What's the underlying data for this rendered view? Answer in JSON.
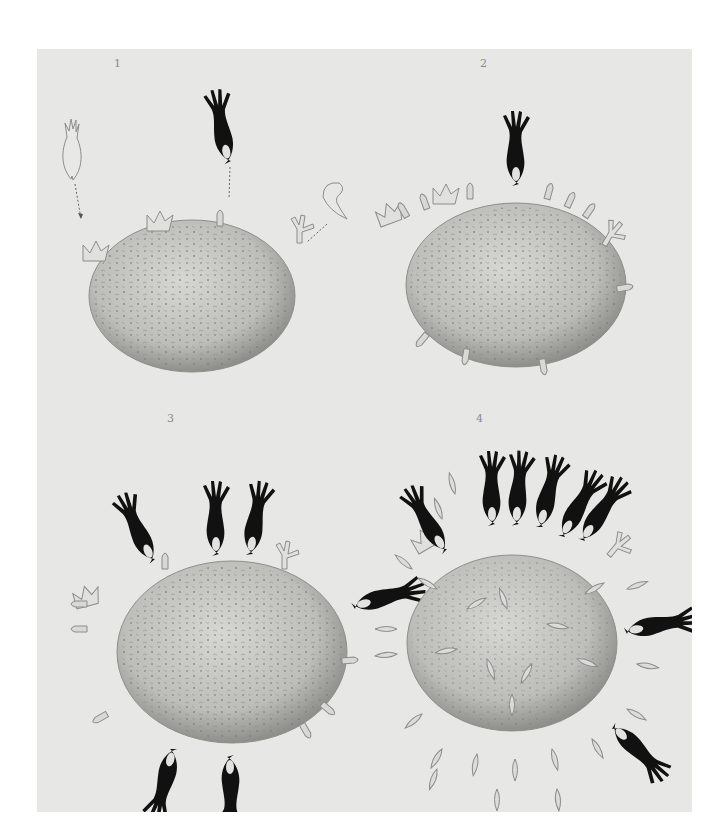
{
  "figure": {
    "panels": [
      {
        "label": "1",
        "x": 114,
        "y": 57,
        "description": "Cell with antigen receptors; three free antibody-like molecules approaching with arrows",
        "attached_black_molecules": 0
      },
      {
        "label": "2",
        "x": 480,
        "y": 57,
        "description": "Cell with multiple receptors; one black molecule bound at top",
        "attached_black_molecules": 1
      },
      {
        "label": "3",
        "x": 167,
        "y": 412,
        "description": "Cell with several black molecules bound to receptors",
        "attached_black_molecules": 6
      },
      {
        "label": "4",
        "x": 476,
        "y": 412,
        "description": "Cell producing many receptors which are shed into surroundings; many black molecules bound",
        "attached_black_molecules": 8
      }
    ],
    "colors": {
      "page_background": "#ffffff",
      "plate_background": "#e7e7e5",
      "cell_fill": "#b9b9b6",
      "molecule_black": "#111111",
      "receptor_fill": "#dcdcda",
      "label_color": "#8a8a8a"
    }
  }
}
